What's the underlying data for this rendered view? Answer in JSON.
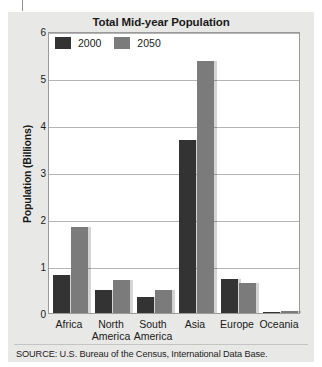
{
  "figure": {
    "title": "Total Mid-year Population",
    "source": "SOURCE: U.S. Bureau of the Census, International Data Base."
  },
  "chart_data": {
    "type": "bar",
    "title": "Total Mid-year Population",
    "xlabel": "",
    "ylabel": "Population (Billions)",
    "ylim": [
      0,
      6
    ],
    "yticks": [
      0,
      1,
      2,
      3,
      4,
      5,
      6
    ],
    "ytick_labels": [
      "0",
      "1",
      "2",
      "3",
      "4",
      "5",
      "6"
    ],
    "grid": true,
    "legend_position": "top-left",
    "categories": [
      "Africa",
      "North America",
      "South America",
      "Asia",
      "Europe",
      "Oceania"
    ],
    "category_lines": [
      [
        "Africa"
      ],
      [
        "North",
        "America"
      ],
      [
        "South",
        "America"
      ],
      [
        "Asia"
      ],
      [
        "Europe"
      ],
      [
        "Oceania"
      ]
    ],
    "series": [
      {
        "name": "2000",
        "color": "#333333",
        "values": [
          0.81,
          0.48,
          0.35,
          3.69,
          0.73,
          0.03
        ]
      },
      {
        "name": "2050",
        "color": "#7b7b7b",
        "values": [
          1.84,
          0.7,
          0.48,
          5.37,
          0.63,
          0.05
        ]
      }
    ]
  },
  "legend": {
    "items": [
      {
        "label": "2000",
        "swatch": "dark-swatch"
      },
      {
        "label": "2050",
        "swatch": "grey-swatch"
      }
    ]
  },
  "colors": {
    "series_2000": "#333333",
    "series_2050": "#7b7b7b",
    "gridline": "#b4b4b4",
    "plot_border": "#9a9a9a",
    "panel_background": "#e8e8e6",
    "plot_background": "#ffffff",
    "text": "#1a1a1a"
  }
}
